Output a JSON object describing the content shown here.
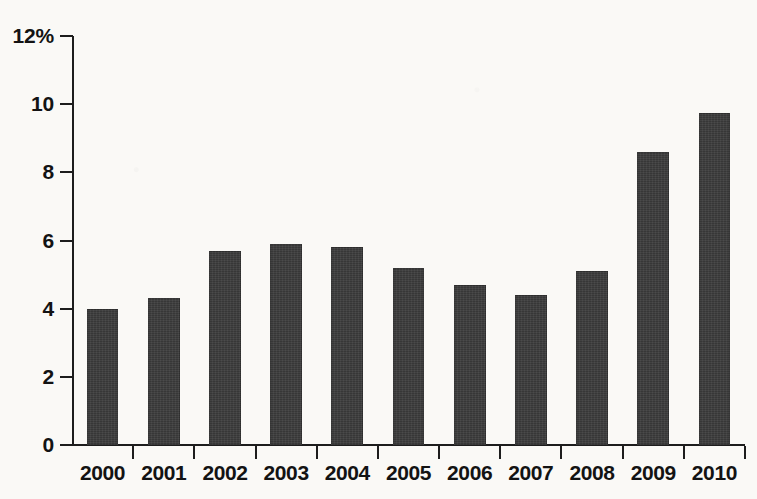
{
  "chart_data": {
    "type": "bar",
    "title": "",
    "subtitle": "",
    "xlabel": "",
    "ylabel": "",
    "categories": [
      "2000",
      "2001",
      "2002",
      "2003",
      "2004",
      "2005",
      "2006",
      "2007",
      "2008",
      "2009",
      "2010"
    ],
    "values": [
      4.0,
      4.3,
      5.7,
      5.9,
      5.8,
      5.2,
      4.7,
      4.4,
      5.1,
      8.6,
      9.75
    ],
    "ylim": [
      0,
      12
    ],
    "y_ticks": [
      0,
      2,
      4,
      6,
      8,
      10,
      12
    ],
    "y_tick_labels": [
      "0",
      "2",
      "4",
      "6",
      "8",
      "10",
      "12%"
    ],
    "unit": "%",
    "grid": false,
    "legend": false,
    "legend_position": "none",
    "series": [
      {
        "name": "",
        "color": "#3c3c3c",
        "values": [
          4.0,
          4.3,
          5.7,
          5.9,
          5.8,
          5.2,
          4.7,
          4.4,
          5.1,
          8.6,
          9.75
        ]
      }
    ]
  },
  "colors": {
    "bar": "#3c3c3c",
    "axis": "#1d1d1d",
    "text": "#131313",
    "background": "#faf9f6"
  }
}
